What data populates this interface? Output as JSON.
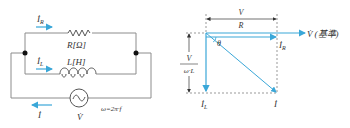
{
  "colors": {
    "wire": "#8c8c8c",
    "accent": "#3aa7d8",
    "text": "#333333",
    "node": "#111111"
  },
  "circuit": {
    "current_IR": "İ",
    "current_IR_sub": "R",
    "resistor_label": "R[Ω]",
    "current_IL": "İ",
    "current_IL_sub": "L",
    "inductor_label": "L[H]",
    "current_I": "İ",
    "source_label": "V̇",
    "omega_label": "ω=2π·f"
  },
  "phasor": {
    "top_frac_num": "V",
    "top_frac_den": "R",
    "left_frac_num": "V",
    "left_frac_den": "ω·L",
    "reference_label": "V̇ (基準)",
    "IR_label": "İ",
    "IR_sub": "R",
    "IL_label": "İ",
    "IL_sub": "L",
    "I_label": "İ",
    "angle_label": "θ"
  }
}
